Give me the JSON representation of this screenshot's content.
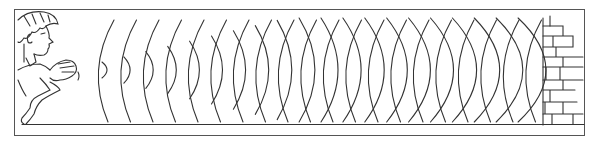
{
  "figure": {
    "elements": [
      "boy-clapping-hands",
      "outgoing-sound-waves",
      "reflected-sound-waves",
      "brick-wall"
    ],
    "colors": {
      "line": "#333333",
      "frame": "#555555",
      "background": "#ffffff"
    },
    "outgoing_wave_count": 20,
    "reflected_wave_count": 20
  }
}
